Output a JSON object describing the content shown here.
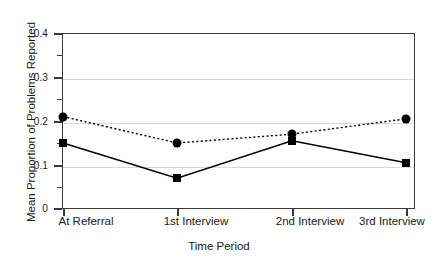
{
  "chart_data": {
    "type": "line",
    "title": "",
    "xlabel": "Time Period",
    "ylabel": "Mean Proportion of Problems Reported",
    "categories": [
      "At Referral",
      "1st Interview",
      "2nd Interview",
      "3rd Interview"
    ],
    "ylim": [
      0,
      0.4
    ],
    "ytick_labels": [
      "0",
      "0.1",
      "0.2",
      "0.3",
      "0.4"
    ],
    "ytick_values": [
      0,
      0.1,
      0.2,
      0.3,
      0.4
    ],
    "yminor_values": [
      0.05,
      0.15,
      0.25,
      0.35
    ],
    "grid": "horizontal-major-only",
    "legend": "none",
    "series": [
      {
        "name": "dotted-circle-series",
        "marker": "circle",
        "linestyle": "dotted",
        "color": "#000000",
        "values": [
          0.21,
          0.15,
          0.17,
          0.205
        ]
      },
      {
        "name": "solid-square-series",
        "marker": "square",
        "linestyle": "solid",
        "color": "#000000",
        "values": [
          0.15,
          0.07,
          0.155,
          0.105
        ]
      }
    ]
  },
  "axes": {
    "frame_color": "#3a3a3a",
    "grid_color": "#d9d9d9"
  }
}
